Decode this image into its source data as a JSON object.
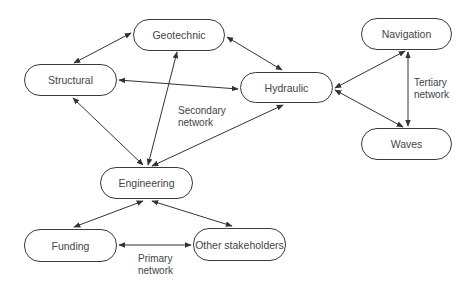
{
  "nodes": {
    "geotechnic": "Geotechnic",
    "structural": "Structural",
    "hydraulic": "Hydraulic",
    "navigation": "Navigation",
    "waves": "Waves",
    "engineering": "Engineering",
    "funding": "Funding",
    "other": "Other stakeholders"
  },
  "labels": {
    "secondary_1": "Secondary",
    "secondary_2": "network",
    "tertiary_1": "Tertiary",
    "tertiary_2": "network",
    "primary_1": "Primary",
    "primary_2": "network"
  },
  "edges": [
    {
      "from": "Structural",
      "to": "Geotechnic",
      "bidirectional": true
    },
    {
      "from": "Geotechnic",
      "to": "Hydraulic",
      "bidirectional": true
    },
    {
      "from": "Structural",
      "to": "Hydraulic",
      "bidirectional": true
    },
    {
      "from": "Hydraulic",
      "to": "Navigation",
      "bidirectional": true
    },
    {
      "from": "Hydraulic",
      "to": "Waves",
      "bidirectional": true
    },
    {
      "from": "Navigation",
      "to": "Waves",
      "bidirectional": true
    },
    {
      "from": "Structural",
      "to": "Engineering",
      "bidirectional": true
    },
    {
      "from": "Geotechnic",
      "to": "Engineering",
      "bidirectional": true
    },
    {
      "from": "Hydraulic",
      "to": "Engineering",
      "bidirectional": true
    },
    {
      "from": "Engineering",
      "to": "Funding",
      "bidirectional": true
    },
    {
      "from": "Engineering",
      "to": "Other stakeholders",
      "bidirectional": true
    },
    {
      "from": "Funding",
      "to": "Other stakeholders",
      "bidirectional": true
    }
  ]
}
